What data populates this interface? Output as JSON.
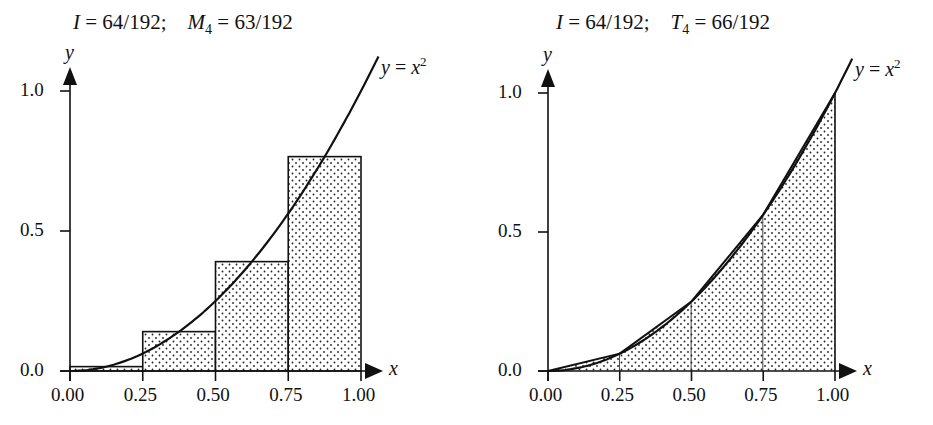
{
  "chart_data": [
    {
      "type": "area",
      "title": "I = 64/192;  M4 = 63/192",
      "title_parts": {
        "exact_label": "I",
        "exact_value": "64/192",
        "approx_label": "M",
        "approx_sub": "4",
        "approx_value": "63/192"
      },
      "method": "midpoint rule, n = 4",
      "function": "y = x^2",
      "curve_label": {
        "lhs": "y",
        "rhs": "x",
        "exp": "2"
      },
      "xlabel": "x",
      "ylabel": "y",
      "xlim": [
        0,
        1
      ],
      "ylim": [
        0,
        1
      ],
      "x_ticks": [
        "0.00",
        "0.25",
        "0.50",
        "0.75",
        "1.00"
      ],
      "y_ticks": [
        "0.0",
        "0.5",
        "1.0"
      ],
      "rectangles": [
        {
          "x0": 0.0,
          "x1": 0.25,
          "height": 0.015625
        },
        {
          "x0": 0.25,
          "x1": 0.5,
          "height": 0.140625
        },
        {
          "x0": 0.5,
          "x1": 0.75,
          "height": 0.390625
        },
        {
          "x0": 0.75,
          "x1": 1.0,
          "height": 0.765625
        }
      ],
      "fill": "dotted stipple",
      "grid": false
    },
    {
      "type": "area",
      "title": "I = 64/192;  T4 = 66/192",
      "title_parts": {
        "exact_label": "I",
        "exact_value": "64/192",
        "approx_label": "T",
        "approx_sub": "4",
        "approx_value": "66/192"
      },
      "method": "trapezoidal rule, n = 4",
      "function": "y = x^2",
      "curve_label": {
        "lhs": "y",
        "rhs": "x",
        "exp": "2"
      },
      "xlabel": "x",
      "ylabel": "y",
      "xlim": [
        0,
        1
      ],
      "ylim": [
        0,
        1
      ],
      "x_ticks": [
        "0.00",
        "0.25",
        "0.50",
        "0.75",
        "1.00"
      ],
      "y_ticks": [
        "0.0",
        "0.5",
        "1.0"
      ],
      "trapezoids": [
        {
          "x0": 0.0,
          "x1": 0.25,
          "y0": 0.0,
          "y1": 0.0625
        },
        {
          "x0": 0.25,
          "x1": 0.5,
          "y0": 0.0625,
          "y1": 0.25
        },
        {
          "x0": 0.5,
          "x1": 0.75,
          "y0": 0.25,
          "y1": 0.5625
        },
        {
          "x0": 0.75,
          "x1": 1.0,
          "y0": 0.5625,
          "y1": 1.0
        }
      ],
      "fill": "dotted stipple",
      "grid": false
    }
  ]
}
